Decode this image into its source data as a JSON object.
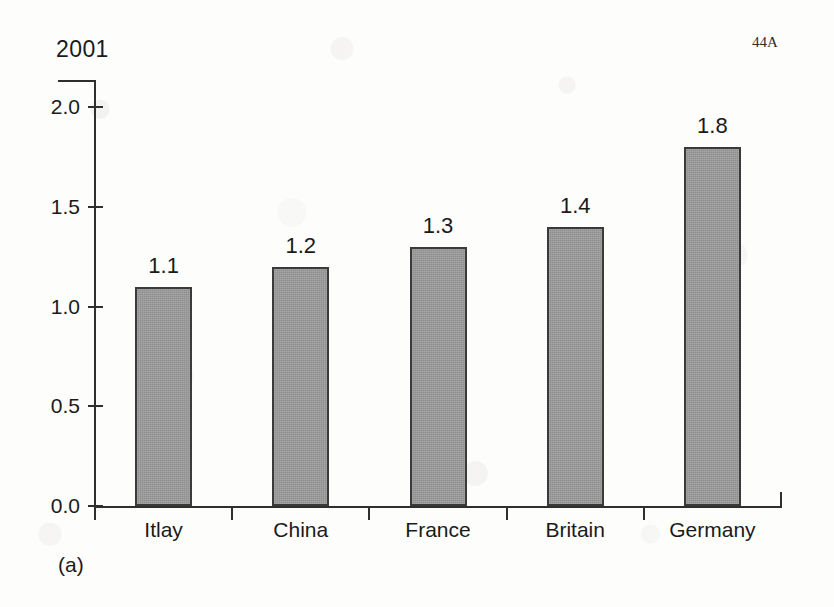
{
  "page": {
    "marker": "44A",
    "caption": "(a)",
    "background_color": "#fdfdfc"
  },
  "chart_data": {
    "type": "bar",
    "title": "2001",
    "xlabel": "",
    "ylabel": "",
    "categories": [
      "Itlay",
      "China",
      "France",
      "Britain",
      "Germany"
    ],
    "values": [
      1.1,
      1.2,
      1.3,
      1.4,
      1.8
    ],
    "value_labels": [
      "1.1",
      "1.2",
      "1.3",
      "1.4",
      "1.8"
    ],
    "ylim": [
      0.0,
      2.0
    ],
    "ytick_labels": [
      "0.0",
      "0.5",
      "1.0",
      "1.5",
      "2.0"
    ],
    "ytick_values": [
      0.0,
      0.5,
      1.0,
      1.5,
      2.0
    ],
    "grid": false,
    "legend": null,
    "bar_fill_color": "#9b9b9b",
    "bar_border_color": "#3a3a3a",
    "axis_color": "#2f2f2f"
  }
}
